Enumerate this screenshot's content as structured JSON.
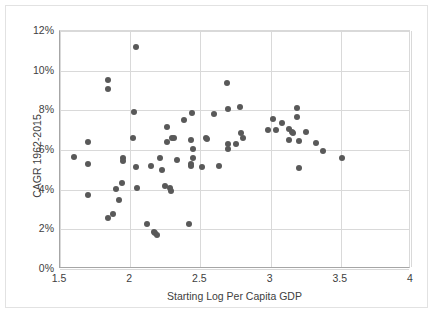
{
  "chart_data": {
    "type": "scatter",
    "title": "",
    "xlabel": "Starting Log Per Capita GDP",
    "ylabel": "CAGR 1962-2015",
    "xlim": [
      1.5,
      4
    ],
    "ylim": [
      0,
      12
    ],
    "xticks": [
      "1.5",
      "2",
      "2.5",
      "3",
      "3.5",
      "4"
    ],
    "xtick_values": [
      1.5,
      2,
      2.5,
      3,
      3.5,
      4
    ],
    "yticks": [
      "0%",
      "2%",
      "4%",
      "6%",
      "8%",
      "10%",
      "12%"
    ],
    "ytick_values": [
      0,
      2,
      4,
      6,
      8,
      10,
      12
    ],
    "grid": true,
    "legend": "none",
    "marker_color": "#595959",
    "points": [
      [
        1.6,
        5.65
      ],
      [
        1.7,
        6.4
      ],
      [
        1.7,
        5.28
      ],
      [
        1.7,
        3.75
      ],
      [
        1.84,
        9.52
      ],
      [
        1.84,
        9.1
      ],
      [
        1.84,
        2.55
      ],
      [
        1.88,
        2.75
      ],
      [
        1.9,
        4.05
      ],
      [
        1.92,
        3.5
      ],
      [
        1.94,
        4.35
      ],
      [
        1.95,
        5.6
      ],
      [
        1.95,
        5.45
      ],
      [
        2.02,
        6.62
      ],
      [
        2.03,
        7.9
      ],
      [
        2.04,
        11.18
      ],
      [
        2.04,
        5.12
      ],
      [
        2.05,
        4.07
      ],
      [
        2.12,
        2.27
      ],
      [
        2.15,
        5.18
      ],
      [
        2.17,
        1.88
      ],
      [
        2.18,
        1.8
      ],
      [
        2.19,
        1.72
      ],
      [
        2.21,
        5.58
      ],
      [
        2.23,
        5.0
      ],
      [
        2.25,
        4.18
      ],
      [
        2.26,
        7.18
      ],
      [
        2.26,
        6.42
      ],
      [
        2.28,
        4.08
      ],
      [
        2.29,
        3.95
      ],
      [
        2.3,
        6.62
      ],
      [
        2.31,
        6.6
      ],
      [
        2.33,
        5.48
      ],
      [
        2.38,
        7.52
      ],
      [
        2.42,
        2.27
      ],
      [
        2.43,
        6.48
      ],
      [
        2.43,
        5.3
      ],
      [
        2.43,
        5.2
      ],
      [
        2.44,
        7.85
      ],
      [
        2.45,
        6.05
      ],
      [
        2.45,
        5.62
      ],
      [
        2.51,
        5.12
      ],
      [
        2.54,
        6.58
      ],
      [
        2.55,
        6.55
      ],
      [
        2.6,
        7.8
      ],
      [
        2.63,
        5.2
      ],
      [
        2.69,
        9.38
      ],
      [
        2.7,
        8.05
      ],
      [
        2.7,
        6.28
      ],
      [
        2.7,
        6.05
      ],
      [
        2.75,
        6.32
      ],
      [
        2.78,
        8.18
      ],
      [
        2.79,
        6.88
      ],
      [
        2.8,
        6.58
      ],
      [
        2.98,
        7.0
      ],
      [
        3.02,
        7.58
      ],
      [
        3.04,
        7.02
      ],
      [
        3.08,
        7.35
      ],
      [
        3.13,
        7.05
      ],
      [
        3.13,
        6.52
      ],
      [
        3.15,
        6.92
      ],
      [
        3.16,
        6.85
      ],
      [
        3.19,
        8.12
      ],
      [
        3.19,
        7.68
      ],
      [
        3.2,
        6.45
      ],
      [
        3.2,
        5.1
      ],
      [
        3.25,
        6.92
      ],
      [
        3.32,
        6.35
      ],
      [
        3.37,
        5.95
      ],
      [
        3.51,
        5.6
      ]
    ]
  }
}
